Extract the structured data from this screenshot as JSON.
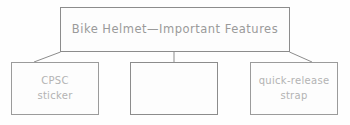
{
  "diagram": {
    "type": "graphic-organizer",
    "background_color": "#fefefe",
    "border_color": "#8c8c8c",
    "text_color": "#9a9a9a",
    "child_text_color": "#b3b3b3",
    "root": {
      "label": "Bike Helmet—Important Features"
    },
    "children": [
      {
        "id": "left",
        "label": "CPSC\nsticker"
      },
      {
        "id": "middle",
        "label": ""
      },
      {
        "id": "right",
        "label": "quick-release\nstrap"
      }
    ],
    "connectors": [
      {
        "name": "connector-root-to-left",
        "shape": "diagonal"
      },
      {
        "name": "connector-root-to-middle",
        "shape": "vertical"
      },
      {
        "name": "connector-root-to-right",
        "shape": "diagonal"
      }
    ]
  }
}
